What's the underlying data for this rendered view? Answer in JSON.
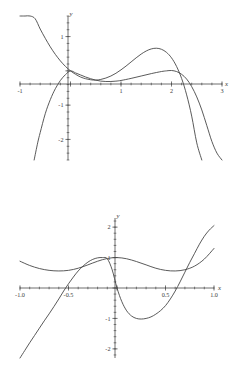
{
  "document": {
    "title": "Function Plots",
    "background_color": "#ffffff",
    "curve_color": "#474747",
    "axis_color": "#4a4a4a"
  },
  "chart_data": [
    {
      "id": "top",
      "type": "line",
      "title": "",
      "xlabel": "x",
      "ylabel": "y",
      "xlim": [
        -1,
        3
      ],
      "ylim": [
        -2.6,
        1.6
      ],
      "grid": false,
      "legend": "none",
      "xticks": [
        -1,
        0,
        1,
        2,
        3
      ],
      "xtick_labels": [
        "-1",
        "",
        "1",
        "2",
        "3"
      ],
      "yticks": [
        -2,
        -1,
        0,
        1
      ],
      "ytick_labels": [
        "-2",
        "-1",
        "",
        "1"
      ],
      "xtick_minor_step": 0.2,
      "ytick_minor_step": 0.2,
      "series": [
        {
          "name": "cubic",
          "comment": "rises steeply from upper-left, passes through origin, dips, rises to local max near x=1.7, falls steeply",
          "x": [
            -1.0,
            -0.9,
            -0.8,
            -0.7,
            -0.6,
            -0.5,
            -0.4,
            -0.3,
            -0.2,
            -0.1,
            0.0,
            0.1,
            0.2,
            0.3,
            0.4,
            0.5,
            0.6,
            0.7,
            0.8,
            0.9,
            1.0,
            1.1,
            1.2,
            1.3,
            1.4,
            1.5,
            1.6,
            1.7,
            1.8,
            1.9,
            2.0,
            2.1,
            2.2,
            2.3,
            2.4,
            2.5,
            2.6
          ],
          "y": [
            2.6,
            2.2,
            1.85,
            1.52,
            1.22,
            0.95,
            0.7,
            0.48,
            0.29,
            0.13,
            0.0,
            -0.1,
            -0.18,
            -0.23,
            -0.26,
            -0.27,
            -0.25,
            -0.21,
            -0.15,
            -0.07,
            0.03,
            0.14,
            0.26,
            0.38,
            0.49,
            0.58,
            0.64,
            0.66,
            0.63,
            0.54,
            0.38,
            0.13,
            -0.22,
            -0.7,
            -1.32,
            -2.1,
            -2.6
          ]
        },
        {
          "name": "quartic",
          "comment": "downward parabola-like arc starting low-left, through origin, shallow trough, rises crossing x-axis near x=2, then falls steeply",
          "x": [
            -0.72,
            -0.65,
            -0.6,
            -0.5,
            -0.4,
            -0.3,
            -0.2,
            -0.1,
            0.0,
            0.1,
            0.2,
            0.3,
            0.4,
            0.5,
            0.6,
            0.7,
            0.8,
            0.9,
            1.0,
            1.2,
            1.4,
            1.6,
            1.8,
            1.9,
            2.0,
            2.1,
            2.2,
            2.3,
            2.4,
            2.5,
            2.6,
            2.7,
            2.8,
            2.9,
            3.0
          ],
          "y": [
            -2.6,
            -2.1,
            -1.8,
            -1.25,
            -0.84,
            -0.52,
            -0.28,
            -0.11,
            0.0,
            -0.06,
            -0.12,
            -0.18,
            -0.23,
            -0.27,
            -0.3,
            -0.31,
            -0.31,
            -0.3,
            -0.28,
            -0.22,
            -0.15,
            -0.08,
            -0.02,
            0.0,
            0.01,
            -0.02,
            -0.1,
            -0.24,
            -0.46,
            -0.76,
            -1.14,
            -1.6,
            -2.06,
            -2.4,
            -2.6
          ]
        }
      ]
    },
    {
      "id": "bottom",
      "type": "line",
      "title": "",
      "xlabel": "x",
      "ylabel": "y",
      "xlim": [
        -1.0,
        1.0
      ],
      "ylim": [
        -2.3,
        2.3
      ],
      "grid": false,
      "legend": "none",
      "xticks": [
        -1.0,
        -0.5,
        0,
        0.5,
        1.0
      ],
      "xtick_labels": [
        "-1.0",
        "-0.5",
        "",
        "0.5",
        "1.0"
      ],
      "yticks": [
        -2,
        -1,
        0,
        1,
        2
      ],
      "ytick_labels": [
        "-2",
        "-1",
        "",
        "1",
        "2"
      ],
      "xtick_minor_step": 0.1,
      "ytick_minor_step": 0.2,
      "series": [
        {
          "name": "flat-wave",
          "comment": "gentle wave: starts ~0.85 at left, dips to ~0.55 near x=-0.6, peaks ~1.0 at x=0, dips to ~0.5 near x=0.55, rises to ~1.3 at right",
          "x": [
            -1.0,
            -0.9,
            -0.8,
            -0.7,
            -0.6,
            -0.5,
            -0.4,
            -0.3,
            -0.2,
            -0.1,
            0.0,
            0.1,
            0.2,
            0.3,
            0.4,
            0.5,
            0.6,
            0.7,
            0.8,
            0.9,
            1.0
          ],
          "y": [
            0.88,
            0.74,
            0.64,
            0.58,
            0.56,
            0.58,
            0.65,
            0.76,
            0.88,
            0.97,
            1.0,
            0.96,
            0.87,
            0.76,
            0.65,
            0.58,
            0.56,
            0.6,
            0.72,
            0.95,
            1.3
          ]
        },
        {
          "name": "s-curve",
          "comment": "steep rising cubic from bottom-left, crosses zero near x=-0.58, local max ~1.0 near x=-0.12, plunges through origin to trough ~-1.0 near x=0.22, rises crossing zero near x=0.62, climbs to 2 at right",
          "x": [
            -1.0,
            -0.95,
            -0.9,
            -0.85,
            -0.8,
            -0.75,
            -0.7,
            -0.65,
            -0.6,
            -0.55,
            -0.5,
            -0.45,
            -0.4,
            -0.35,
            -0.3,
            -0.25,
            -0.2,
            -0.15,
            -0.1,
            -0.05,
            0.0,
            0.05,
            0.1,
            0.15,
            0.2,
            0.25,
            0.3,
            0.35,
            0.4,
            0.45,
            0.5,
            0.55,
            0.6,
            0.65,
            0.7,
            0.75,
            0.8,
            0.85,
            0.9,
            0.95,
            1.0
          ],
          "y": [
            -2.3,
            -2.05,
            -1.8,
            -1.56,
            -1.32,
            -1.08,
            -0.85,
            -0.61,
            -0.36,
            -0.1,
            0.14,
            0.36,
            0.56,
            0.72,
            0.85,
            0.94,
            0.99,
            1.0,
            0.96,
            0.6,
            0.0,
            -0.45,
            -0.75,
            -0.92,
            -1.0,
            -1.02,
            -1.0,
            -0.95,
            -0.86,
            -0.74,
            -0.58,
            -0.36,
            -0.1,
            0.2,
            0.52,
            0.84,
            1.14,
            1.44,
            1.7,
            1.9,
            2.05
          ]
        }
      ]
    }
  ]
}
